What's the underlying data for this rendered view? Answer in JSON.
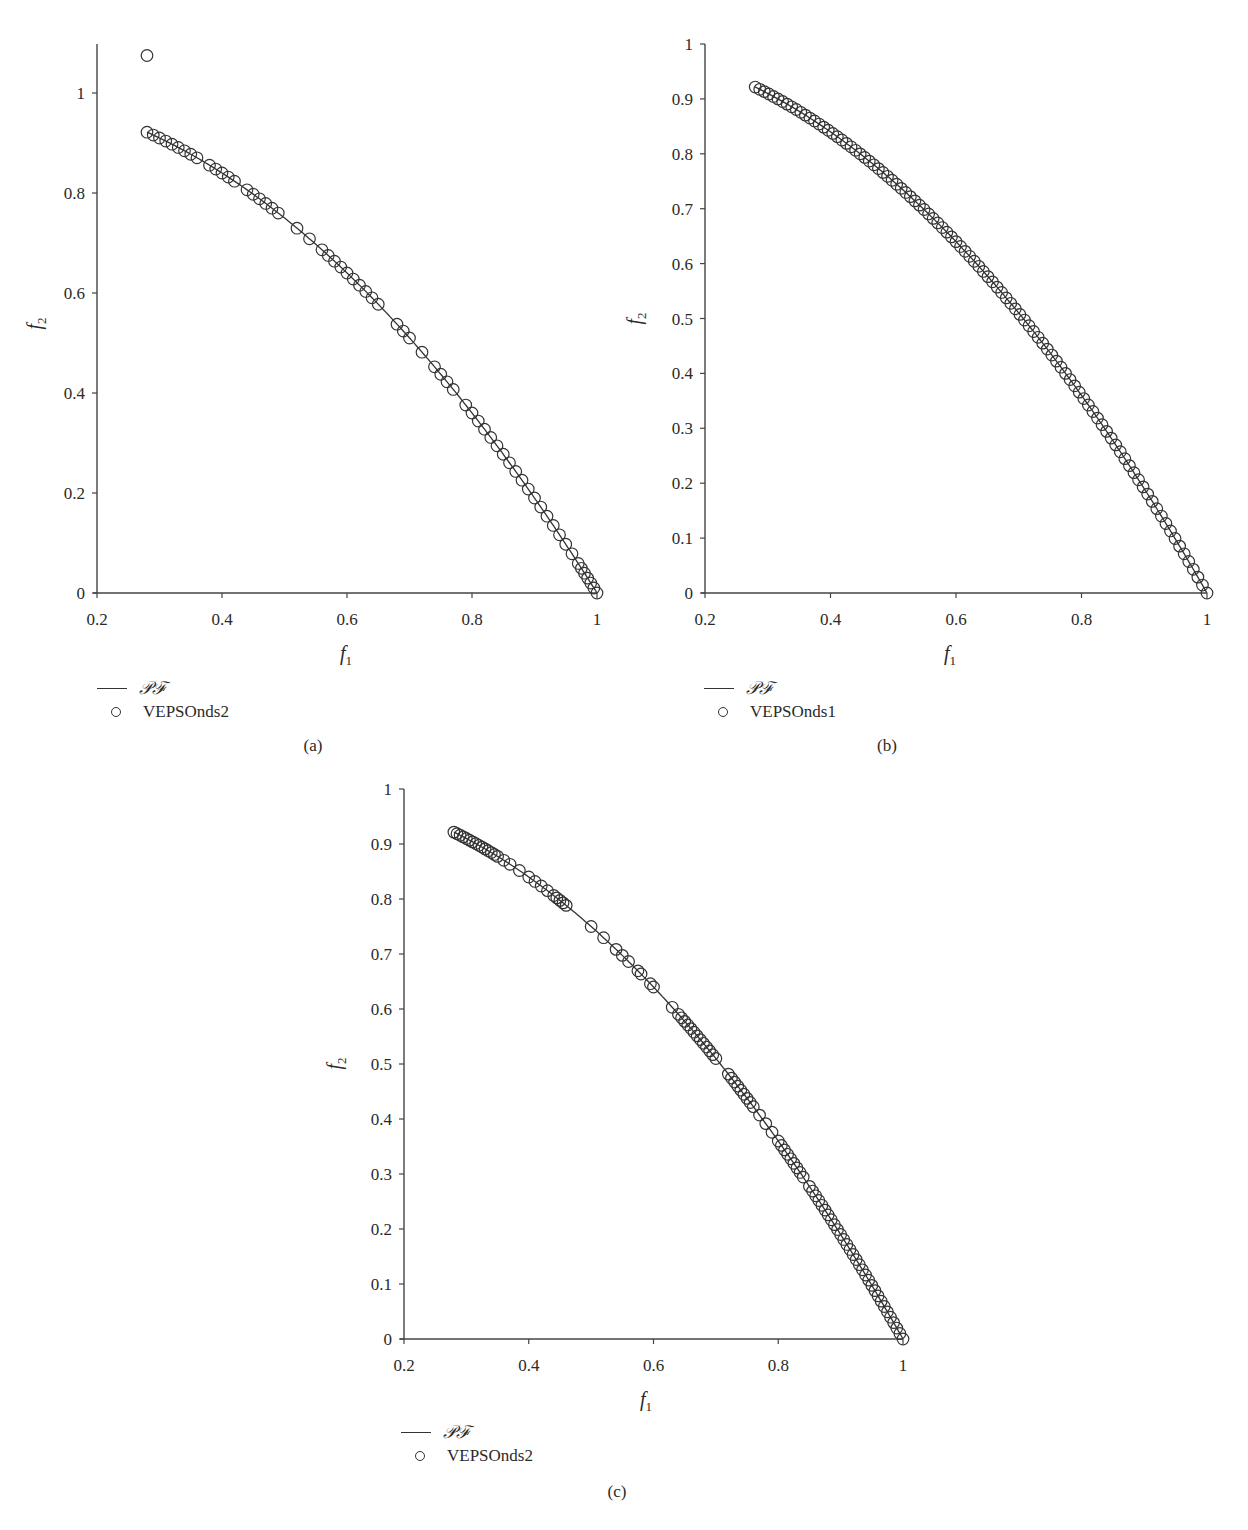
{
  "figure": {
    "panels": [
      {
        "id": "a",
        "caption": "(a)",
        "legend": {
          "line_label": "𝒫ℱ",
          "marker_label": "VEPSOnds2"
        },
        "xlabel": "f",
        "xlabel_sub": "1",
        "ylabel": "f",
        "ylabel_sub": "2"
      },
      {
        "id": "b",
        "caption": "(b)",
        "legend": {
          "line_label": "𝒫ℱ",
          "marker_label": "VEPSOnds1"
        },
        "xlabel": "f",
        "xlabel_sub": "1",
        "ylabel": "f",
        "ylabel_sub": "2"
      },
      {
        "id": "c",
        "caption": "(c)",
        "legend": {
          "line_label": "𝒫ℱ",
          "marker_label": "VEPSOnds2"
        },
        "xlabel": "f",
        "xlabel_sub": "1",
        "ylabel": "f",
        "ylabel_sub": "2"
      }
    ]
  },
  "chart_data": [
    {
      "type": "scatter",
      "panel": "(a)",
      "title": "",
      "xlabel": "f1",
      "ylabel": "f2",
      "xlim": [
        0.2,
        1.0
      ],
      "ylim": [
        0,
        1.1
      ],
      "xticks": [
        "0.2",
        "0.4",
        "0.6",
        "0.8",
        "1"
      ],
      "yticks": [
        "0",
        "0.2",
        "0.4",
        "0.6",
        "0.8",
        "1"
      ],
      "grid": false,
      "legend_position": "bottom-left",
      "series": [
        {
          "name": "𝒫ℱ",
          "kind": "line",
          "function": "f2 = 1 - f1^2",
          "x_range": [
            0.28,
            1.0
          ]
        },
        {
          "name": "VEPSOnds2",
          "kind": "markers",
          "marker": "open-circle",
          "f1": [
            0.28,
            0.29,
            0.3,
            0.31,
            0.32,
            0.33,
            0.34,
            0.35,
            0.36,
            0.38,
            0.39,
            0.4,
            0.41,
            0.42,
            0.44,
            0.45,
            0.46,
            0.47,
            0.48,
            0.49,
            0.52,
            0.54,
            0.56,
            0.57,
            0.58,
            0.59,
            0.6,
            0.61,
            0.62,
            0.63,
            0.64,
            0.65,
            0.68,
            0.69,
            0.7,
            0.72,
            0.74,
            0.75,
            0.76,
            0.77,
            0.79,
            0.8,
            0.81,
            0.82,
            0.83,
            0.84,
            0.85,
            0.86,
            0.87,
            0.88,
            0.89,
            0.9,
            0.91,
            0.92,
            0.93,
            0.94,
            0.95,
            0.96,
            0.97,
            0.975,
            0.98,
            0.985,
            0.99,
            0.995,
            1.0
          ],
          "outliers": [
            {
              "f1": 0.28,
              "f2": 1.075
            }
          ]
        }
      ]
    },
    {
      "type": "scatter",
      "panel": "(b)",
      "title": "",
      "xlabel": "f1",
      "ylabel": "f2",
      "xlim": [
        0.2,
        1.0
      ],
      "ylim": [
        0,
        1.0
      ],
      "xticks": [
        "0.2",
        "0.4",
        "0.6",
        "0.8",
        "1"
      ],
      "yticks": [
        "0",
        "0.1",
        "0.2",
        "0.3",
        "0.4",
        "0.5",
        "0.6",
        "0.7",
        "0.8",
        "0.9",
        "1"
      ],
      "grid": false,
      "legend_position": "bottom-left",
      "series": [
        {
          "name": "𝒫ℱ",
          "kind": "line",
          "function": "f2 = 1 - f1^2",
          "x_range": [
            0.28,
            1.0
          ]
        },
        {
          "name": "VEPSOnds1",
          "kind": "markers",
          "marker": "open-circle",
          "uniform_count": 100,
          "x_range": [
            0.28,
            1.0
          ]
        }
      ]
    },
    {
      "type": "scatter",
      "panel": "(c)",
      "title": "",
      "xlabel": "f1",
      "ylabel": "f2",
      "xlim": [
        0.2,
        1.0
      ],
      "ylim": [
        0,
        1.0
      ],
      "xticks": [
        "0.2",
        "0.4",
        "0.6",
        "0.8",
        "1"
      ],
      "yticks": [
        "0",
        "0.1",
        "0.2",
        "0.3",
        "0.4",
        "0.5",
        "0.6",
        "0.7",
        "0.8",
        "0.9",
        "1"
      ],
      "grid": false,
      "legend_position": "bottom-left",
      "series": [
        {
          "name": "𝒫ℱ",
          "kind": "line",
          "function": "f2 = 1 - f1^2",
          "x_range": [
            0.28,
            1.0
          ]
        },
        {
          "name": "VEPSOnds2",
          "kind": "markers",
          "marker": "open-circle",
          "f1": [
            0.28,
            0.285,
            0.29,
            0.295,
            0.3,
            0.305,
            0.31,
            0.315,
            0.32,
            0.325,
            0.33,
            0.335,
            0.34,
            0.345,
            0.35,
            0.36,
            0.37,
            0.385,
            0.4,
            0.41,
            0.42,
            0.43,
            0.44,
            0.445,
            0.45,
            0.455,
            0.46,
            0.5,
            0.52,
            0.54,
            0.55,
            0.56,
            0.575,
            0.58,
            0.595,
            0.6,
            0.63,
            0.64,
            0.645,
            0.65,
            0.655,
            0.66,
            0.665,
            0.67,
            0.675,
            0.68,
            0.685,
            0.69,
            0.695,
            0.7,
            0.72,
            0.725,
            0.73,
            0.735,
            0.74,
            0.745,
            0.75,
            0.755,
            0.76,
            0.77,
            0.78,
            0.79,
            0.8,
            0.805,
            0.81,
            0.815,
            0.82,
            0.825,
            0.83,
            0.835,
            0.84,
            0.85,
            0.855,
            0.86,
            0.865,
            0.87,
            0.875,
            0.88,
            0.885,
            0.89,
            0.895,
            0.9,
            0.905,
            0.91,
            0.915,
            0.92,
            0.925,
            0.93,
            0.935,
            0.94,
            0.945,
            0.95,
            0.955,
            0.96,
            0.965,
            0.97,
            0.975,
            0.98,
            0.985,
            0.99,
            0.995,
            1.0
          ]
        }
      ]
    }
  ]
}
